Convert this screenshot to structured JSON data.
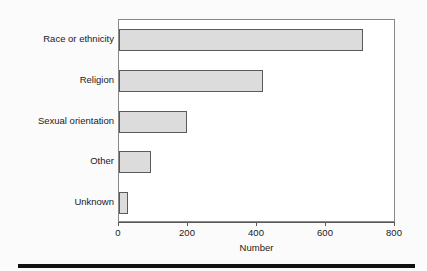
{
  "chart_data": {
    "type": "bar",
    "orientation": "horizontal",
    "title": "",
    "subtitle": "",
    "xlabel": "Number",
    "ylabel": "",
    "categories": [
      "Race or ethnicity",
      "Religion",
      "Sexual orientation",
      "Other",
      "Unknown"
    ],
    "values": [
      707,
      417,
      197,
      93,
      26
    ],
    "xlim": [
      0,
      800
    ],
    "xticks": [
      0,
      200,
      400,
      600,
      800
    ],
    "xtick_labels": [
      "0",
      "200",
      "400",
      "600",
      "800"
    ],
    "grid": false,
    "legend": false,
    "legend_position": "none",
    "series": [
      {
        "name": "Number",
        "values": [
          707,
          417,
          197,
          93,
          26
        ]
      }
    ]
  },
  "style": {
    "bar_fill": "#dcdcdc",
    "bar_edge": "#5a5a5a",
    "frame_color": "#888888",
    "axis_color": "#5a5a5a",
    "text_color": "#1a1a1a",
    "page_background": "#fbfbfb",
    "plot_background": "#ffffff",
    "rule_color": "#111111"
  }
}
